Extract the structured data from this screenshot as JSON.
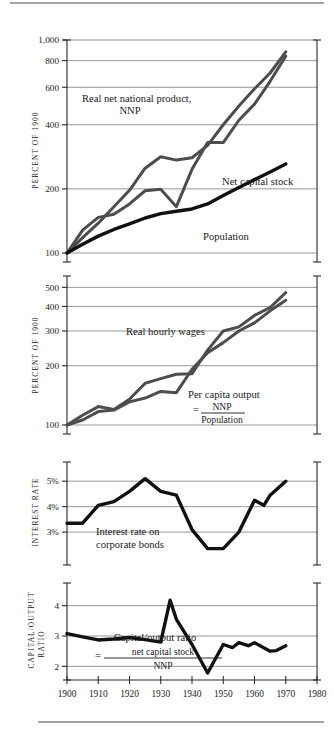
{
  "figure": {
    "x_axis": {
      "label": "",
      "ticks": [
        "1900",
        "1910",
        "1920",
        "1930",
        "1940",
        "1950",
        "1960",
        "1970",
        "1980"
      ],
      "min": 1900,
      "max": 1980
    },
    "panels": [
      {
        "id": "panel-growth",
        "axis_title": "PERCENT OF 1900",
        "y_ticks": [
          "1,000",
          "800",
          "600",
          "400",
          "200",
          "100"
        ],
        "annotations": [
          {
            "id": "nnp",
            "line1": "Real net national product,",
            "line2": "NNP"
          },
          {
            "id": "capital",
            "line1": "Net capital stock"
          },
          {
            "id": "population",
            "line1": "Population"
          }
        ]
      },
      {
        "id": "panel-wages",
        "axis_title": "PERCENT OF 1900",
        "y_ticks": [
          "500",
          "400",
          "300",
          "200",
          "100"
        ],
        "annotations": [
          {
            "id": "wages",
            "line1": "Real hourly wages"
          },
          {
            "id": "percapita",
            "line1": "Per capita output",
            "eq": "=",
            "num": "NNP",
            "den": "Population"
          }
        ]
      },
      {
        "id": "panel-interest",
        "axis_title": "INTEREST RATE",
        "y_ticks": [
          "5%",
          "4%",
          "3%"
        ],
        "annotations": [
          {
            "id": "interest",
            "line1": "Interest rate on",
            "line2": "corporate bonds"
          }
        ]
      },
      {
        "id": "panel-ratio",
        "axis_title": "CAPITAL/OUTPUT RATIO",
        "axis_title_line1": "CAPITAL/OUTPUT",
        "axis_title_line2": "RATIO",
        "y_ticks": [
          "4",
          "3",
          "2"
        ],
        "annotations": [
          {
            "id": "ratio",
            "line1": "Capital/output ratio",
            "eq": "=",
            "num": "net capital stock",
            "den": "NNP"
          }
        ]
      }
    ]
  },
  "chart_data": [
    {
      "type": "line",
      "id": "panel-growth",
      "title": "",
      "xlabel": "",
      "ylabel": "PERCENT OF 1900",
      "yscale": "log",
      "ylim": [
        100,
        1000
      ],
      "yticks": [
        100,
        200,
        400,
        600,
        800,
        1000
      ],
      "xlim": [
        1900,
        1980
      ],
      "grid": true,
      "legend": "inline-annotations",
      "x": [
        1900,
        1905,
        1910,
        1915,
        1920,
        1925,
        1930,
        1935,
        1940,
        1945,
        1950,
        1955,
        1960,
        1965,
        1970
      ],
      "series": [
        {
          "name": "Real net national product, NNP",
          "color": "#4d4d4d",
          "values": [
            100,
            128,
            147,
            152,
            170,
            196,
            199,
            165,
            247,
            330,
            330,
            420,
            500,
            640,
            840
          ]
        },
        {
          "name": "Net capital stock",
          "color": "#4d4d4d",
          "values": [
            100,
            118,
            138,
            165,
            197,
            250,
            283,
            273,
            280,
            320,
            400,
            490,
            590,
            700,
            880
          ]
        },
        {
          "name": "Population",
          "color": "#111111",
          "values": [
            100,
            110,
            120,
            129,
            137,
            146,
            153,
            157,
            161,
            170,
            186,
            203,
            221,
            240,
            262
          ]
        }
      ]
    },
    {
      "type": "line",
      "id": "panel-wages",
      "title": "",
      "xlabel": "",
      "ylabel": "PERCENT OF 1900",
      "yscale": "log",
      "ylim": [
        100,
        520
      ],
      "yticks": [
        100,
        200,
        300,
        400,
        500
      ],
      "xlim": [
        1900,
        1980
      ],
      "grid": true,
      "legend": "inline-annotations",
      "x": [
        1900,
        1905,
        1910,
        1915,
        1920,
        1925,
        1930,
        1935,
        1940,
        1945,
        1950,
        1955,
        1960,
        1965,
        1970
      ],
      "series": [
        {
          "name": "Real hourly wages",
          "color": "#4d4d4d",
          "values": [
            100,
            112,
            124,
            120,
            135,
            163,
            172,
            181,
            182,
            240,
            300,
            315,
            360,
            395,
            470
          ]
        },
        {
          "name": "Per capita output = NNP / Population",
          "color": "#4d4d4d",
          "values": [
            100,
            106,
            117,
            119,
            131,
            137,
            148,
            146,
            192,
            233,
            262,
            300,
            330,
            380,
            430
          ]
        }
      ]
    },
    {
      "type": "line",
      "id": "panel-interest",
      "title": "",
      "xlabel": "",
      "ylabel": "INTEREST RATE",
      "yscale": "linear",
      "ylim": [
        2.1,
        5.4
      ],
      "yticks": [
        3,
        4,
        5
      ],
      "ytick_labels": [
        "3%",
        "4%",
        "5%"
      ],
      "xlim": [
        1900,
        1980
      ],
      "grid": true,
      "x": [
        1900,
        1905,
        1910,
        1915,
        1920,
        1925,
        1930,
        1935,
        1940,
        1945,
        1950,
        1955,
        1960,
        1963,
        1965,
        1970
      ],
      "series": [
        {
          "name": "Interest rate on corporate bonds",
          "color": "#111111",
          "values": [
            3.35,
            3.35,
            4.05,
            4.2,
            4.6,
            5.1,
            4.6,
            4.45,
            3.1,
            2.35,
            2.35,
            3.0,
            4.25,
            4.05,
            4.45,
            5.0
          ]
        }
      ]
    },
    {
      "type": "line",
      "id": "panel-ratio",
      "title": "",
      "xlabel": "",
      "ylabel": "CAPITAL/OUTPUT RATIO",
      "yscale": "linear",
      "ylim": [
        1.55,
        4.45
      ],
      "yticks": [
        2,
        3,
        4
      ],
      "xlim": [
        1900,
        1980
      ],
      "grid": true,
      "x": [
        1900,
        1905,
        1910,
        1915,
        1920,
        1925,
        1930,
        1933,
        1935,
        1940,
        1945,
        1950,
        1953,
        1955,
        1958,
        1960,
        1965,
        1967,
        1970
      ],
      "series": [
        {
          "name": "Capital/output ratio = net capital stock / NNP",
          "color": "#111111",
          "values": [
            3.08,
            2.97,
            2.87,
            2.9,
            2.95,
            2.88,
            2.8,
            4.18,
            3.55,
            2.72,
            1.78,
            2.72,
            2.62,
            2.78,
            2.68,
            2.78,
            2.5,
            2.52,
            2.68
          ]
        }
      ]
    }
  ]
}
